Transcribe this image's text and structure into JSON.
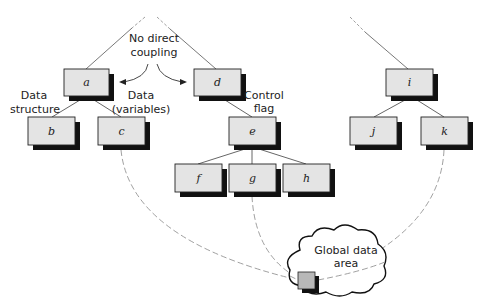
{
  "diagram": {
    "type": "module-coupling-hierarchy",
    "colors": {
      "box_fill": "#e4e4e4",
      "box_border": "#222222",
      "shadow": "#111111",
      "line": "#555555",
      "dashed": "#888888",
      "global_fill": "#b8b8b8"
    },
    "nodes": [
      {
        "id": "a",
        "label": "a"
      },
      {
        "id": "b",
        "label": "b"
      },
      {
        "id": "c",
        "label": "c"
      },
      {
        "id": "d",
        "label": "d"
      },
      {
        "id": "e",
        "label": "e"
      },
      {
        "id": "f",
        "label": "f"
      },
      {
        "id": "g",
        "label": "g"
      },
      {
        "id": "h",
        "label": "h"
      },
      {
        "id": "i",
        "label": "i"
      },
      {
        "id": "j",
        "label": "j"
      },
      {
        "id": "k",
        "label": "k"
      }
    ],
    "edges": [
      {
        "from": "a",
        "to": "b"
      },
      {
        "from": "a",
        "to": "c"
      },
      {
        "from": "d",
        "to": "e"
      },
      {
        "from": "e",
        "to": "f"
      },
      {
        "from": "e",
        "to": "g"
      },
      {
        "from": "e",
        "to": "h"
      },
      {
        "from": "i",
        "to": "j"
      },
      {
        "from": "i",
        "to": "k"
      }
    ],
    "global_links": [
      "c",
      "g",
      "k"
    ],
    "annotations": {
      "no_direct_coupling_line1": "No direct",
      "no_direct_coupling_line2": "coupling",
      "data_structure_line1": "Data",
      "data_structure_line2": "structure",
      "data_variables_line1": "Data",
      "data_variables_line2": "(variables)",
      "control_flag_line1": "Control",
      "control_flag_line2": "flag",
      "global_data_line1": "Global data",
      "global_data_line2": "area"
    }
  }
}
